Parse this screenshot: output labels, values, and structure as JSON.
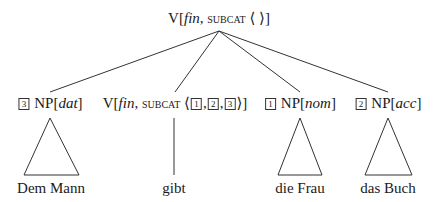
{
  "root": {
    "cat": "V",
    "feat1": "fin",
    "feat2": "subcat",
    "list": "⟨ ⟩"
  },
  "daughters": [
    {
      "tag": "3",
      "cat": "NP",
      "case": "dat",
      "word": "Dem Mann",
      "leaf": "triangle"
    },
    {
      "cat": "V",
      "feat1": "fin",
      "feat2": "subcat",
      "list_open": "⟨",
      "list_tags": [
        "1",
        "2",
        "3"
      ],
      "list_close": "⟩",
      "word": "gibt",
      "leaf": "line"
    },
    {
      "tag": "1",
      "cat": "NP",
      "case": "nom",
      "word": "die Frau",
      "leaf": "triangle"
    },
    {
      "tag": "2",
      "cat": "NP",
      "case": "acc",
      "word": "das Buch",
      "leaf": "triangle"
    }
  ]
}
